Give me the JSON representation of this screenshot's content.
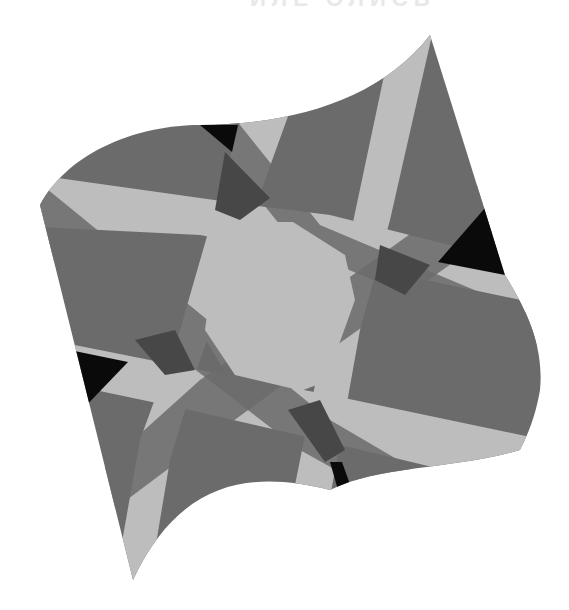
{
  "artwork": {
    "title_fragment": "ИЛЕ ОЛИСЬ",
    "description": "Eight-pointed star geometric pattern inside a curved wave-like outline, grayscale",
    "colors": {
      "background": "#ffffff",
      "base_gray": "#6b6b6b",
      "light_gray": "#bdbdbd",
      "dark_gray": "#474747",
      "black": "#0a0a0a"
    }
  }
}
